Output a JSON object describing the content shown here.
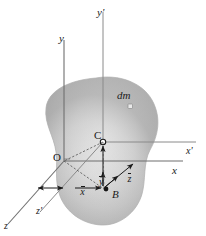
{
  "figure": {
    "kind": "mechanics-diagram",
    "background_color": "#ffffff",
    "body_fill_light": "#e6e6e6",
    "body_fill_mid": "#c9c9c9",
    "body_fill_dark": "#a8a8a8",
    "line_color": "#6b6b6b",
    "label_color": "#1a1a1a"
  },
  "axes": {
    "primary": {
      "origin_label": "O",
      "x_label": "x",
      "y_label": "y",
      "z_label": "z"
    },
    "centroidal": {
      "x_label": "x'",
      "y_label": "y'",
      "z_label": "z'"
    }
  },
  "points": {
    "mass_center": "C",
    "reference_point": "B",
    "mass_element": "dm"
  },
  "dimensions": {
    "x_bar": "x",
    "y_bar": "y",
    "z_bar": "z"
  }
}
